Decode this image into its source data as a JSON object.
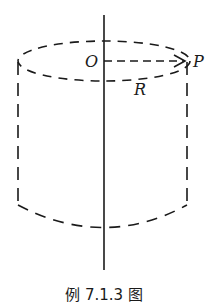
{
  "figure": {
    "labels": {
      "origin": "O",
      "point": "P",
      "radius": "R"
    },
    "caption": "例 7.1.3 图",
    "colors": {
      "stroke": "#1a1a1a",
      "background": "#ffffff"
    }
  }
}
